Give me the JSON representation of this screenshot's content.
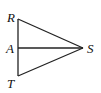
{
  "diagram": {
    "type": "geometry-triangle",
    "stroke_color": "#222222",
    "points": {
      "R": {
        "label": "R",
        "x": 18,
        "y": 19
      },
      "A": {
        "label": "A",
        "x": 18,
        "y": 48
      },
      "T": {
        "label": "T",
        "x": 18,
        "y": 76
      },
      "S": {
        "label": "S",
        "x": 83,
        "y": 48
      }
    },
    "segments": [
      [
        "R",
        "T"
      ],
      [
        "R",
        "S"
      ],
      [
        "T",
        "S"
      ],
      [
        "A",
        "S"
      ]
    ]
  }
}
